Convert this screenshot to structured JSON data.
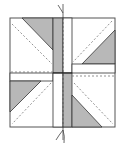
{
  "diagram": {
    "type": "quilt-block-pattern",
    "colors": {
      "background": "#ffffff",
      "fill_gray": "#b8b8b8",
      "line": "#333333",
      "dashed": "#666666"
    },
    "block": {
      "x": 10,
      "y": 18,
      "width": 105,
      "height": 109
    },
    "center": {
      "x": 63,
      "y": 73
    },
    "strips": {
      "vertical_top_gray": {
        "x": 53,
        "w": 10
      },
      "vertical_bottom_gray": {
        "x": 63,
        "w": 9
      },
      "horizontal_right_band": {
        "y": 64,
        "h": 9
      },
      "horizontal_left_band": {
        "y": 73,
        "h": 8
      }
    },
    "fold_line": {
      "x": 63,
      "y_top": 2,
      "y_bottom": 144
    }
  }
}
